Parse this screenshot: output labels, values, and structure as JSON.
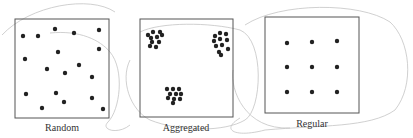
{
  "panels": [
    {
      "label": "Random",
      "box": [
        15,
        19,
        94,
        99
      ],
      "dots": [
        [
          23,
          36
        ],
        [
          38,
          36
        ],
        [
          55,
          29
        ],
        [
          74,
          33
        ],
        [
          99,
          30
        ],
        [
          25,
          59
        ],
        [
          58,
          52
        ],
        [
          99,
          49
        ],
        [
          47,
          69
        ],
        [
          65,
          73
        ],
        [
          79,
          65
        ],
        [
          92,
          77
        ],
        [
          26,
          94
        ],
        [
          56,
          93
        ],
        [
          64,
          102
        ],
        [
          92,
          98
        ],
        [
          42,
          108
        ],
        [
          103,
          109
        ]
      ]
    },
    {
      "label": "Aggregated",
      "box": [
        140,
        19,
        93,
        98
      ],
      "dots": [
        [
          148,
          35
        ],
        [
          153,
          32
        ],
        [
          160,
          32
        ],
        [
          151,
          38
        ],
        [
          157,
          37
        ],
        [
          162,
          35
        ],
        [
          152,
          42
        ],
        [
          159,
          42
        ],
        [
          150,
          46
        ],
        [
          156,
          47
        ],
        [
          215,
          36
        ],
        [
          220,
          33
        ],
        [
          226,
          34
        ],
        [
          214,
          41
        ],
        [
          220,
          39
        ],
        [
          227,
          40
        ],
        [
          216,
          46
        ],
        [
          222,
          45
        ],
        [
          228,
          49
        ],
        [
          219,
          52
        ],
        [
          221,
          55
        ],
        [
          167,
          89
        ],
        [
          173,
          89
        ],
        [
          179,
          89
        ],
        [
          170,
          94
        ],
        [
          176,
          94
        ],
        [
          181,
          94
        ],
        [
          168,
          98
        ],
        [
          174,
          99
        ],
        [
          180,
          99
        ],
        [
          173,
          103
        ]
      ]
    },
    {
      "label": "Regular",
      "box": [
        265,
        17,
        94,
        96
      ],
      "dots": [
        [
          287,
          43
        ],
        [
          312,
          42
        ],
        [
          337,
          41
        ],
        [
          287,
          67
        ],
        [
          312,
          67
        ],
        [
          337,
          67
        ],
        [
          287,
          92
        ],
        [
          312,
          92
        ],
        [
          337,
          92
        ]
      ]
    }
  ],
  "colors": {
    "dot": "#222222",
    "box": "#555555",
    "sketch": "#bbbbbb"
  }
}
